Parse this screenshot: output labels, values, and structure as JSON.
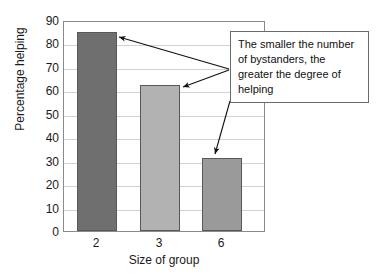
{
  "chart_data": {
    "type": "bar",
    "title": "",
    "xlabel": "Size of group",
    "ylabel": "Percentage helping",
    "categories": [
      "2",
      "3",
      "6"
    ],
    "values": [
      85.6,
      62.8,
      31.6
    ],
    "ylim": [
      0,
      90
    ],
    "ytick_values": [
      "90",
      "80",
      "70",
      "60",
      "50",
      "40",
      "30",
      "20",
      "10",
      "0"
    ],
    "grid": true,
    "legend": "none",
    "bar_colors": [
      "#6f6f6f",
      "#b2b2b2",
      "#9a9a9a"
    ],
    "bar_edge_color": "#585858",
    "annotations": [
      {
        "text": "The smaller the number of bystanders, the greater the degree of helping",
        "lines": [
          "The smaller the number",
          "of bystanders, the",
          "greater the degree of",
          "helping"
        ],
        "points_to": [
          "2",
          "3",
          "6"
        ]
      }
    ]
  },
  "axes": {
    "y_title": "Percentage helping",
    "x_title": "Size of group"
  }
}
